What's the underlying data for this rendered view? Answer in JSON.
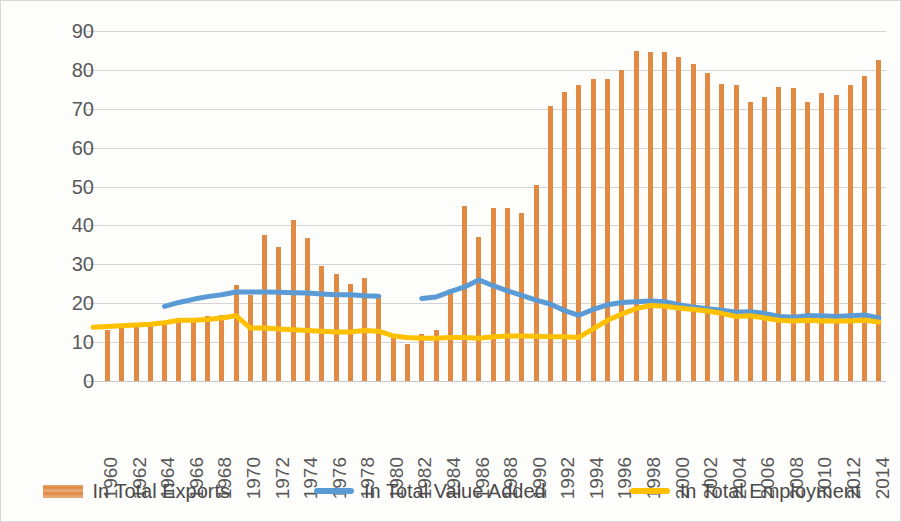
{
  "chart_data": {
    "type": "bar",
    "title": "",
    "subtitle": "",
    "xlabel": "",
    "ylabel": "",
    "ylim": [
      0,
      90
    ],
    "y_ticks": [
      0,
      10,
      20,
      30,
      40,
      50,
      60,
      70,
      80,
      90
    ],
    "grid": true,
    "legend_position": "bottom",
    "x": [
      1960,
      1961,
      1962,
      1963,
      1964,
      1965,
      1966,
      1967,
      1968,
      1969,
      1970,
      1971,
      1972,
      1973,
      1974,
      1975,
      1976,
      1977,
      1978,
      1979,
      1980,
      1981,
      1982,
      1983,
      1984,
      1985,
      1986,
      1987,
      1988,
      1989,
      1990,
      1991,
      1992,
      1993,
      1994,
      1995,
      1996,
      1997,
      1998,
      1999,
      2000,
      2001,
      2002,
      2003,
      2004,
      2005,
      2006,
      2007,
      2008,
      2009,
      2010,
      2011,
      2012,
      2013,
      2014,
      2015
    ],
    "x_tick_labels": [
      "1960",
      "1962",
      "1964",
      "1966",
      "1968",
      "1970",
      "1972",
      "1974",
      "1976",
      "1978",
      "1980",
      "1982",
      "1984",
      "1986",
      "1988",
      "1990",
      "1992",
      "1994",
      "1996",
      "1998",
      "2000",
      "2002",
      "2004",
      "2006",
      "2008",
      "2010",
      "2012",
      "2014"
    ],
    "series": [
      {
        "name": "In Total Exports",
        "kind": "bar",
        "color": "#e08a44",
        "values": [
          null,
          13.2,
          13.6,
          13.8,
          14.2,
          14.6,
          16.0,
          16.2,
          16.8,
          17.0,
          24.8,
          22.0,
          37.5,
          34.5,
          41.5,
          36.8,
          29.5,
          27.5,
          25.0,
          26.5,
          21.8,
          12.0,
          9.6,
          12.2,
          13.0,
          23.0,
          45.0,
          37.0,
          44.5,
          44.5,
          43.2,
          50.5,
          70.8,
          74.4,
          76.0,
          77.6,
          77.6,
          80.0,
          84.8,
          84.5,
          84.5,
          83.2,
          81.6,
          79.2,
          76.5,
          76.0,
          71.8,
          73.0,
          75.6,
          75.4,
          71.8,
          74.0,
          73.6,
          76.2,
          78.4,
          82.6
        ]
      },
      {
        "name": "In Total Value Added",
        "kind": "line",
        "color": "#5b9bd5",
        "values": [
          null,
          null,
          null,
          null,
          null,
          19.2,
          20.2,
          21.0,
          21.7,
          22.2,
          22.9,
          22.9,
          22.9,
          22.8,
          22.7,
          22.6,
          22.4,
          22.2,
          22.2,
          21.9,
          21.8,
          null,
          null,
          21.2,
          21.6,
          23.0,
          24.2,
          26.0,
          24.5,
          23.2,
          22.0,
          20.8,
          19.8,
          18.1,
          16.9,
          18.4,
          19.6,
          20.2,
          20.4,
          20.6,
          20.4,
          19.6,
          19.0,
          18.6,
          18.2,
          17.7,
          17.8,
          17.4,
          16.6,
          16.4,
          16.8,
          16.8,
          16.6,
          16.8,
          17.0,
          16.2
        ]
      },
      {
        "name": "In Total Employment",
        "kind": "line",
        "color": "#ffc000",
        "values": [
          13.8,
          14.0,
          14.2,
          14.4,
          14.6,
          15.0,
          15.6,
          15.6,
          15.8,
          16.2,
          16.8,
          13.6,
          13.6,
          13.4,
          13.2,
          13.0,
          12.8,
          12.6,
          12.6,
          13.0,
          12.8,
          11.6,
          11.2,
          11.0,
          11.0,
          11.2,
          11.2,
          11.0,
          11.4,
          11.6,
          11.6,
          11.5,
          11.4,
          11.4,
          11.2,
          13.4,
          15.6,
          17.2,
          18.6,
          19.4,
          19.2,
          18.8,
          18.4,
          18.0,
          17.4,
          16.6,
          16.8,
          16.2,
          15.6,
          15.4,
          15.6,
          15.4,
          15.4,
          15.4,
          15.6,
          15.2
        ]
      }
    ]
  },
  "legend": {
    "items": [
      {
        "label": "In Total Exports",
        "type": "bar",
        "color": "#e08a44"
      },
      {
        "label": "In Total Value Added",
        "type": "line",
        "color": "#5b9bd5"
      },
      {
        "label": "In Total Employment",
        "type": "line",
        "color": "#ffc000"
      }
    ]
  }
}
